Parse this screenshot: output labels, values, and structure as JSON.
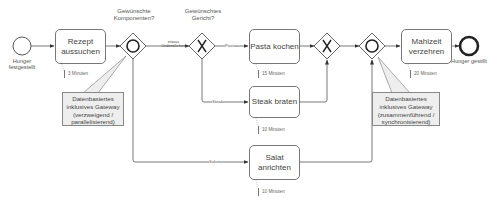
{
  "diagram": {
    "type": "BPMN process",
    "events": {
      "start": {
        "label": "Hunger festgestellt"
      },
      "end": {
        "label": "Hunger gestillt"
      }
    },
    "tasks": [
      {
        "id": "rezept",
        "label": "Rezept aussuchen",
        "duration": "3 Minuten"
      },
      {
        "id": "pasta",
        "label": "Pasta kochen",
        "duration": "15 Minuten"
      },
      {
        "id": "steak",
        "label": "Steak braten",
        "duration": "10 Minuten"
      },
      {
        "id": "salat",
        "label": "Salat anrichten",
        "duration": "10 Minuten"
      },
      {
        "id": "mahlzeit",
        "label": "Mahlzeit verzehren",
        "duration": "20 Minuten"
      }
    ],
    "gateways": [
      {
        "id": "or_split",
        "kind": "inclusive",
        "question": "Gewünschte Komponenten?"
      },
      {
        "id": "xor_split",
        "kind": "exclusive",
        "question": "Gewünschtes Gericht?"
      },
      {
        "id": "xor_join",
        "kind": "exclusive"
      },
      {
        "id": "or_join",
        "kind": "inclusive"
      }
    ],
    "flow_labels": {
      "ordentliches": "etwas Ordentliches",
      "pasta": "Pasta",
      "steak": "Steak",
      "salat": "Salat"
    },
    "annotations": [
      {
        "id": "note_split",
        "lines": [
          "Datenbasiertes",
          "inklusives Gateway",
          "(verzweigend /",
          "parallelisierend)"
        ]
      },
      {
        "id": "note_join",
        "lines": [
          "Datenbasiertes",
          "inklusives Gateway",
          "(zusammenführend /",
          "synchronisierend)"
        ]
      }
    ],
    "colors": {
      "stroke": "#555555",
      "note_fill": "#eeeeee",
      "text": "#444444"
    }
  }
}
